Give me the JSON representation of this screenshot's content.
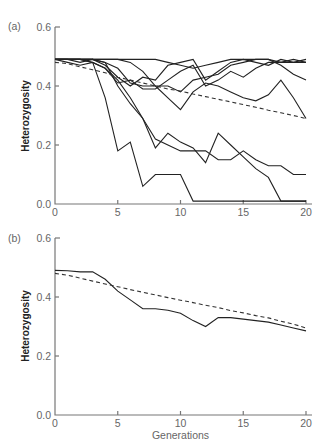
{
  "chart_data": [
    {
      "panel": "(a)",
      "type": "line",
      "title": "",
      "xlabel": "",
      "ylabel": "Heterozygosity",
      "xlim": [
        0,
        20
      ],
      "ylim": [
        0.0,
        0.6
      ],
      "xticks": [
        "0",
        "5",
        "10",
        "15",
        "20"
      ],
      "yticks": [
        "0.0",
        "0.2",
        "0.4",
        "0.6"
      ],
      "grid": false,
      "legend": "none",
      "x": [
        0,
        1,
        2,
        3,
        4,
        5,
        6,
        7,
        8,
        9,
        10,
        11,
        12,
        13,
        14,
        15,
        16,
        17,
        18,
        19,
        20
      ],
      "series": [
        {
          "name": "replicate 1",
          "style": "solid",
          "values": [
            0.49,
            0.49,
            0.49,
            0.49,
            0.49,
            0.49,
            0.49,
            0.49,
            0.49,
            0.48,
            0.47,
            0.46,
            0.47,
            0.48,
            0.49,
            0.49,
            0.49,
            0.49,
            0.48,
            0.48,
            0.48
          ]
        },
        {
          "name": "replicate 2",
          "style": "solid",
          "values": [
            0.49,
            0.49,
            0.48,
            0.49,
            0.47,
            0.43,
            0.4,
            0.43,
            0.42,
            0.47,
            0.48,
            0.49,
            0.42,
            0.45,
            0.48,
            0.49,
            0.48,
            0.47,
            0.49,
            0.48,
            0.49
          ]
        },
        {
          "name": "replicate 3",
          "style": "solid",
          "values": [
            0.49,
            0.48,
            0.47,
            0.48,
            0.46,
            0.41,
            0.42,
            0.39,
            0.39,
            0.42,
            0.45,
            0.47,
            0.4,
            0.42,
            0.45,
            0.43,
            0.46,
            0.48,
            0.48,
            0.49,
            0.48
          ]
        },
        {
          "name": "replicate 4",
          "style": "solid",
          "values": [
            0.49,
            0.49,
            0.49,
            0.49,
            0.48,
            0.46,
            0.41,
            0.4,
            0.4,
            0.4,
            0.38,
            0.42,
            0.43,
            0.44,
            0.47,
            0.48,
            0.49,
            0.49,
            0.47,
            0.44,
            0.42
          ]
        },
        {
          "name": "replicate 5",
          "style": "solid",
          "values": [
            0.49,
            0.49,
            0.49,
            0.49,
            0.49,
            0.49,
            0.48,
            0.45,
            0.4,
            0.36,
            0.32,
            0.38,
            0.41,
            0.4,
            0.38,
            0.36,
            0.35,
            0.37,
            0.42,
            0.36,
            0.29
          ]
        },
        {
          "name": "replicate 6",
          "style": "solid",
          "values": [
            0.49,
            0.49,
            0.49,
            0.49,
            0.48,
            0.4,
            0.34,
            0.29,
            0.22,
            0.2,
            0.18,
            0.18,
            0.18,
            0.15,
            0.15,
            0.18,
            0.15,
            0.13,
            0.13,
            0.1,
            0.1
          ]
        },
        {
          "name": "replicate 7",
          "style": "solid",
          "values": [
            0.49,
            0.49,
            0.49,
            0.48,
            0.46,
            0.42,
            0.36,
            0.29,
            0.19,
            0.24,
            0.21,
            0.19,
            0.14,
            0.24,
            0.2,
            0.16,
            0.12,
            0.09,
            0.01,
            0.01,
            0.01
          ]
        },
        {
          "name": "replicate 8",
          "style": "solid",
          "values": [
            0.49,
            0.49,
            0.49,
            0.48,
            0.36,
            0.18,
            0.21,
            0.06,
            0.1,
            0.1,
            0.1,
            0.01,
            0.01,
            0.01,
            0.01,
            0.01,
            0.01,
            0.01,
            0.01,
            0.01,
            0.01
          ]
        },
        {
          "name": "expected",
          "style": "dashed",
          "values": [
            0.48,
            0.476,
            0.465,
            0.455,
            0.445,
            0.43,
            0.42,
            0.41,
            0.4,
            0.39,
            0.383,
            0.373,
            0.364,
            0.355,
            0.346,
            0.337,
            0.328,
            0.318,
            0.309,
            0.3,
            0.29
          ]
        }
      ]
    },
    {
      "panel": "(b)",
      "type": "line",
      "title": "",
      "xlabel": "Generations",
      "ylabel": "Heterozygosity",
      "xlim": [
        0,
        20
      ],
      "ylim": [
        0.0,
        0.6
      ],
      "xticks": [
        "0",
        "5",
        "10",
        "15",
        "20"
      ],
      "yticks": [
        "0.0",
        "0.2",
        "0.4",
        "0.6"
      ],
      "grid": false,
      "legend": "none",
      "x": [
        0,
        1,
        2,
        3,
        4,
        5,
        6,
        7,
        8,
        9,
        10,
        11,
        12,
        13,
        14,
        15,
        16,
        17,
        18,
        19,
        20
      ],
      "series": [
        {
          "name": "mean of replicates",
          "style": "solid",
          "values": [
            0.49,
            0.489,
            0.485,
            0.485,
            0.46,
            0.42,
            0.39,
            0.36,
            0.36,
            0.355,
            0.345,
            0.32,
            0.3,
            0.33,
            0.33,
            0.325,
            0.32,
            0.315,
            0.305,
            0.295,
            0.285
          ]
        },
        {
          "name": "expected",
          "style": "dashed",
          "values": [
            0.48,
            0.474,
            0.464,
            0.454,
            0.444,
            0.435,
            0.425,
            0.416,
            0.407,
            0.398,
            0.389,
            0.381,
            0.372,
            0.364,
            0.354,
            0.346,
            0.337,
            0.329,
            0.318,
            0.308,
            0.295
          ]
        }
      ]
    }
  ],
  "panels": {
    "a": {
      "label": "(a)",
      "ylabel": "Heterozygosity",
      "yticks": [
        "0.0",
        "0.2",
        "0.4",
        "0.6"
      ],
      "xticks": [
        "0",
        "5",
        "10",
        "15",
        "20"
      ]
    },
    "b": {
      "label": "(b)",
      "ylabel": "Heterozygosity",
      "yticks": [
        "0.0",
        "0.2",
        "0.4",
        "0.6"
      ],
      "xticks": [
        "0",
        "5",
        "10",
        "15",
        "20"
      ],
      "xlabel": "Generations"
    }
  }
}
